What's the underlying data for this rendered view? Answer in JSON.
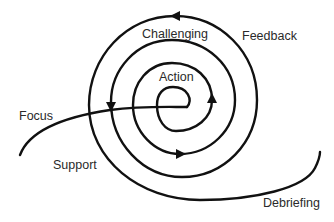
{
  "diagram": {
    "type": "spiral",
    "stroke_color": "#111111",
    "background": "#ffffff",
    "labels": {
      "challenging": "Challenging",
      "feedback": "Feedback",
      "action": "Action",
      "focus": "Focus",
      "support": "Support",
      "debriefing": "Debriefing"
    },
    "arrows": [
      {
        "position": "top",
        "direction": "left"
      },
      {
        "position": "left",
        "direction": "down"
      },
      {
        "position": "bottom",
        "direction": "right"
      },
      {
        "position": "right",
        "direction": "up"
      }
    ]
  }
}
